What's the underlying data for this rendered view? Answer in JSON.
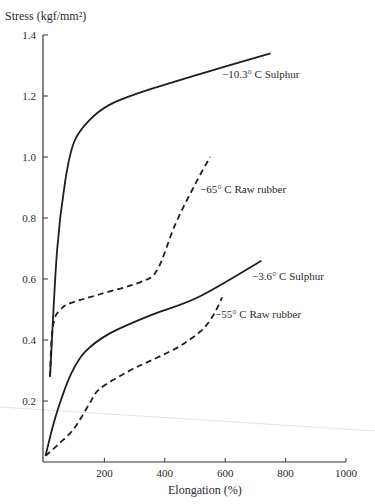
{
  "chart_data": {
    "type": "line",
    "title": "",
    "xlabel": "Elongation (%)",
    "ylabel": "Stress (kgf/mm²)",
    "xlim": [
      0,
      1000
    ],
    "ylim": [
      0,
      1.4
    ],
    "grid": false,
    "legend": "inline labels at line ends",
    "x_ticks": [
      200,
      400,
      600,
      800,
      1000
    ],
    "x_tick_labels": [
      "200",
      "400",
      "600",
      "800",
      "1000"
    ],
    "y_ticks": [
      0.2,
      0.4,
      0.6,
      0.8,
      1.0,
      1.2,
      1.4
    ],
    "y_tick_labels": [
      "0.2",
      "0.4",
      "0.6",
      "0.8",
      "1.0",
      "1.2",
      "1.4"
    ],
    "series": [
      {
        "name": "−10.3° C  Sulphur",
        "style": "solid",
        "x": [
          20,
          43,
          70,
          100,
          150,
          215,
          315,
          510,
          750
        ],
        "y": [
          0.28,
          0.69,
          0.92,
          1.05,
          1.12,
          1.17,
          1.21,
          1.27,
          1.34
        ],
        "label_pos": [
          222,
          78
        ]
      },
      {
        "name": "−65° C  Raw rubber",
        "style": "dashed",
        "x": [
          20,
          25,
          35,
          55,
          85,
          185,
          320,
          375,
          435,
          500,
          550
        ],
        "y": [
          0.28,
          0.4,
          0.47,
          0.5,
          0.52,
          0.55,
          0.59,
          0.63,
          0.78,
          0.91,
          1.0
        ],
        "label_pos": [
          200,
          193
        ]
      },
      {
        "name": "−3.6° C  Sulphur",
        "style": "solid",
        "x": [
          5,
          30,
          55,
          90,
          135,
          215,
          350,
          510,
          720
        ],
        "y": [
          0.02,
          0.12,
          0.2,
          0.29,
          0.36,
          0.42,
          0.48,
          0.54,
          0.66
        ],
        "label_pos": [
          252,
          280
        ]
      },
      {
        "name": "−55° C  Raw rubber",
        "style": "dashed",
        "x": [
          5,
          50,
          100,
          150,
          185,
          285,
          370,
          450,
          520,
          560,
          590
        ],
        "y": [
          0.02,
          0.06,
          0.11,
          0.19,
          0.24,
          0.3,
          0.34,
          0.38,
          0.43,
          0.48,
          0.54
        ],
        "label_pos": [
          215,
          318
        ]
      }
    ]
  },
  "axes": {
    "ylabel": "Stress (kgf/mm²)",
    "xlabel": "Elongation (%)"
  }
}
